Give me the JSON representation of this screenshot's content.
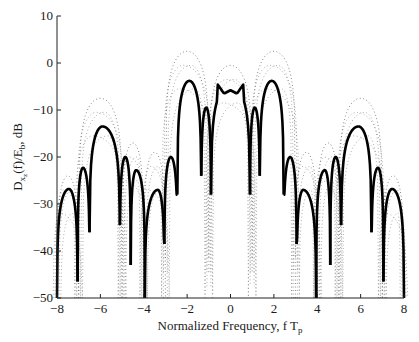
{
  "chart_data": {
    "type": "line",
    "title": "",
    "xlabel": "Normalized Frequency, f T",
    "xlabel_subscript": "p",
    "ylabel": "D",
    "ylabel_sub": "x",
    "ylabel_subsub": "z",
    "ylabel_rest": "(f)/E",
    "ylabel_sub2": "b",
    "ylabel_tail": ", dB",
    "xlim": [
      -8,
      8
    ],
    "ylim": [
      -50,
      10
    ],
    "xticks": [
      -8,
      -6,
      -4,
      -2,
      0,
      2,
      4,
      6,
      8
    ],
    "xtick_labels": [
      "−8",
      "−6",
      "−4",
      "−2",
      "0",
      "2",
      "4",
      "6",
      "8"
    ],
    "yticks": [
      10,
      0,
      -10,
      -20,
      -30,
      -40,
      -50
    ],
    "ytick_labels": [
      "10",
      "0",
      "−10",
      "−20",
      "−30",
      "−40",
      "−50"
    ],
    "grid": false,
    "legend": null,
    "series": [
      {
        "name": "solid (main spectrum)",
        "style": "solid",
        "color": "#000000",
        "lobes": [
          {
            "x0": -8.0,
            "x1": -7.05,
            "peak_x": -7.45,
            "peak_y": -26.8,
            "null_y": -50
          },
          {
            "x0": -7.05,
            "x1": -6.5,
            "peak_x": -6.8,
            "peak_y": -22.3,
            "null_y": -46.5
          },
          {
            "x0": -6.5,
            "x1": -5.1,
            "peak_x": -5.9,
            "peak_y": -13.5,
            "null_y": -36.0
          },
          {
            "x0": -5.1,
            "x1": -4.6,
            "peak_x": -4.85,
            "peak_y": -20.0,
            "null_y": -34.5
          },
          {
            "x0": -4.6,
            "x1": -3.95,
            "peak_x": -4.35,
            "peak_y": -22.8,
            "null_y": -43.0
          },
          {
            "x0": -3.95,
            "x1": -3.05,
            "peak_x": -3.35,
            "peak_y": -27.0,
            "null_y": -50
          },
          {
            "x0": -3.05,
            "x1": -2.45,
            "peak_x": -2.75,
            "peak_y": -20.0,
            "null_y": -38.5
          },
          {
            "x0": -2.45,
            "x1": -1.35,
            "peak_x": -1.9,
            "peak_y": -3.8,
            "null_y": -28.0
          },
          {
            "x0": -1.35,
            "x1": -0.9,
            "peak_x": -1.12,
            "peak_y": -9.5,
            "null_y": -24.0
          },
          {
            "x0": -0.9,
            "x1": 0.9,
            "peak_x": 0.0,
            "peak_y": -4.5,
            "null_y": -28.0
          },
          {
            "x0": 0.9,
            "x1": 1.35,
            "peak_x": 1.12,
            "peak_y": -9.5,
            "null_y": -28.0
          },
          {
            "x0": 1.35,
            "x1": 2.45,
            "peak_x": 1.9,
            "peak_y": -3.8,
            "null_y": -24.0
          },
          {
            "x0": 2.45,
            "x1": 3.05,
            "peak_x": 2.75,
            "peak_y": -20.0,
            "null_y": -28.0
          },
          {
            "x0": 3.05,
            "x1": 3.95,
            "peak_x": 3.35,
            "peak_y": -27.0,
            "null_y": -38.5
          },
          {
            "x0": 3.95,
            "x1": 4.6,
            "peak_x": 4.35,
            "peak_y": -22.8,
            "null_y": -50
          },
          {
            "x0": 4.6,
            "x1": 5.1,
            "peak_x": 4.85,
            "peak_y": -20.0,
            "null_y": -43.0
          },
          {
            "x0": 5.1,
            "x1": 6.5,
            "peak_x": 5.9,
            "peak_y": -13.5,
            "null_y": -34.5
          },
          {
            "x0": 6.5,
            "x1": 7.05,
            "peak_x": 6.8,
            "peak_y": -22.3,
            "null_y": -36.0
          },
          {
            "x0": 7.05,
            "x1": 8.0,
            "peak_x": 7.45,
            "peak_y": -26.8,
            "null_y": -46.5
          }
        ],
        "center_detail": {
          "x": [
            -0.6,
            -0.3,
            0.0,
            0.3,
            0.6
          ],
          "y": [
            -4.5,
            -6.5,
            -5.8,
            -6.5,
            -4.5
          ]
        }
      },
      {
        "name": "dotted (envelope / alternate spectra)",
        "style": "dotted",
        "color": "#555555",
        "lobes": [
          {
            "x0": -8.0,
            "x1": -7.0,
            "peak_x": -7.5,
            "peak_y": -24.0
          },
          {
            "x0": -7.0,
            "x1": -5.0,
            "peak_x": -6.0,
            "peak_y": -7.5
          },
          {
            "x0": -5.0,
            "x1": -4.0,
            "peak_x": -4.5,
            "peak_y": -17.0
          },
          {
            "x0": -4.0,
            "x1": -3.0,
            "peak_x": -3.5,
            "peak_y": -19.0
          },
          {
            "x0": -3.0,
            "x1": -1.0,
            "peak_x": -2.0,
            "peak_y": 2.5
          },
          {
            "x0": -1.0,
            "x1": 1.0,
            "peak_x": 0.0,
            "peak_y": -0.5
          },
          {
            "x0": 1.0,
            "x1": 3.0,
            "peak_x": 2.0,
            "peak_y": 2.5
          },
          {
            "x0": 3.0,
            "x1": 4.0,
            "peak_x": 3.5,
            "peak_y": -19.0
          },
          {
            "x0": 4.0,
            "x1": 5.0,
            "peak_x": 4.5,
            "peak_y": -17.0
          },
          {
            "x0": 5.0,
            "x1": 7.0,
            "peak_x": 6.0,
            "peak_y": -7.5
          },
          {
            "x0": 7.0,
            "x1": 8.0,
            "peak_x": 7.5,
            "peak_y": -24.0
          }
        ]
      }
    ]
  }
}
